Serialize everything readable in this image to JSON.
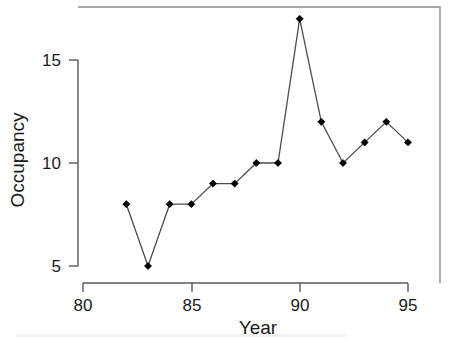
{
  "chart_data": {
    "type": "line",
    "title": "",
    "subtitle": "",
    "xlabel": "Year",
    "ylabel": "Occupancy",
    "x": [
      82,
      83,
      84,
      85,
      86,
      87,
      88,
      89,
      90,
      91,
      92,
      93,
      94,
      95
    ],
    "values": [
      8,
      5,
      8,
      8,
      9,
      9,
      10,
      10,
      17,
      12,
      10,
      11,
      12,
      11
    ],
    "series": [
      {
        "name": "Occupancy",
        "values": [
          8,
          5,
          8,
          8,
          9,
          9,
          10,
          10,
          17,
          12,
          10,
          11,
          12,
          11
        ]
      }
    ],
    "points": [
      {
        "x": 82,
        "y": 8
      },
      {
        "x": 83,
        "y": 5
      },
      {
        "x": 84,
        "y": 8
      },
      {
        "x": 85,
        "y": 8
      },
      {
        "x": 86,
        "y": 9
      },
      {
        "x": 87,
        "y": 9
      },
      {
        "x": 88,
        "y": 10
      },
      {
        "x": 89,
        "y": 10
      },
      {
        "x": 90,
        "y": 17
      },
      {
        "x": 91,
        "y": 12
      },
      {
        "x": 92,
        "y": 10
      },
      {
        "x": 93,
        "y": 11
      },
      {
        "x": 94,
        "y": 12
      },
      {
        "x": 95,
        "y": 11
      }
    ],
    "xticks": [
      80,
      85,
      90,
      95
    ],
    "xtick_labels": [
      "80",
      "85",
      "90",
      "95"
    ],
    "yticks": [
      5,
      10,
      15
    ],
    "ytick_labels": [
      "5",
      "10",
      "15"
    ],
    "xlim": [
      78.6,
      96.6
    ],
    "ylim": [
      3.8,
      17.9
    ],
    "grid": false,
    "legend": false,
    "legend_position": "none",
    "marker": "filled-diamond",
    "line_color": "#4d4d4d",
    "marker_color": "#000000",
    "background_color": "#ffffff",
    "frame": true
  },
  "axes": {
    "x_title": "Year",
    "y_title": "Occupancy"
  }
}
